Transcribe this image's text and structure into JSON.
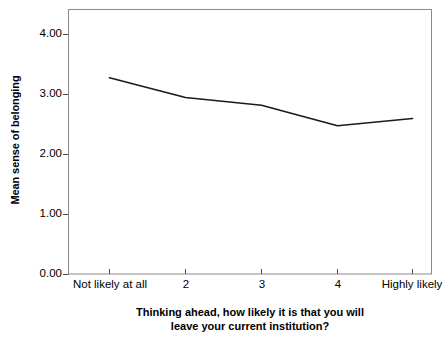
{
  "chart_data": {
    "type": "line",
    "title": "",
    "subtitle": "",
    "xlabel_line1": "Thinking ahead, how likely it is that you will",
    "xlabel_line2": "leave your current institution?",
    "ylabel": "Mean sense of belonging",
    "categories": [
      "Not likely at all",
      "2",
      "3",
      "4",
      "Highly likely"
    ],
    "values": [
      3.28,
      2.95,
      2.82,
      2.48,
      2.6
    ],
    "series": [
      {
        "name": "Mean sense of belonging",
        "values": [
          3.28,
          2.95,
          2.82,
          2.48,
          2.6
        ]
      }
    ],
    "ylim": [
      0.0,
      4.5
    ],
    "ytick_values": [
      0.0,
      1.0,
      2.0,
      3.0,
      4.0
    ],
    "ytick_labels": [
      "0.00",
      "1.00",
      "2.00",
      "3.00",
      "4.00"
    ],
    "xlim_index": [
      0,
      4
    ],
    "grid": false,
    "legend": false,
    "legend_position": "none",
    "line_color": "#1a1a1a",
    "frame_color": "#808080",
    "background_color": "#ffffff",
    "markers": false
  }
}
